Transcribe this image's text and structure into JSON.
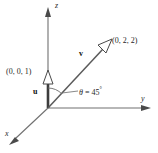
{
  "figure": {
    "type": "vector-diagram-3d",
    "background_color": "#ffffff",
    "stroke_color": "#6b6b6b",
    "text_color": "#1a1a1a"
  },
  "axes": {
    "z": {
      "label": "z"
    },
    "y": {
      "label": "y"
    },
    "x": {
      "label": "x"
    }
  },
  "vectors": {
    "u": {
      "label": "u",
      "point_label": "(0, 0, 1)",
      "components": [
        0,
        0,
        1
      ]
    },
    "v": {
      "label": "v",
      "point_label": "(0, 2, 2)",
      "components": [
        0,
        2,
        2
      ]
    }
  },
  "angle": {
    "symbol": "θ",
    "equals": "=",
    "value": "45",
    "degree": "°",
    "text": "θ = 45°"
  }
}
